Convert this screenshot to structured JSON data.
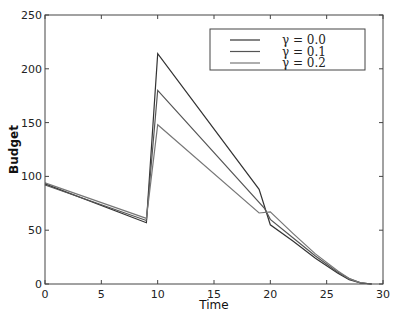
{
  "chart_data": {
    "type": "line",
    "title": "",
    "xlabel": "Time",
    "ylabel": "Budget",
    "xlim": [
      0,
      30
    ],
    "ylim": [
      0,
      250
    ],
    "xticks": [
      0,
      5,
      10,
      15,
      20,
      25,
      30
    ],
    "yticks": [
      0,
      50,
      100,
      150,
      200,
      250
    ],
    "legend_position": "upper right",
    "grid": false,
    "series": [
      {
        "name": "γ = 0.0",
        "color": "#333333",
        "x": [
          0,
          9,
          10,
          19,
          20,
          22,
          24,
          26,
          27,
          28,
          29
        ],
        "y": [
          93,
          57,
          214,
          88,
          55,
          40,
          24,
          10,
          4,
          1,
          0
        ]
      },
      {
        "name": "γ = 0.1",
        "color": "#555555",
        "x": [
          0,
          9,
          10,
          19.5,
          20,
          22,
          24,
          26,
          27,
          28,
          29
        ],
        "y": [
          92,
          59,
          180,
          70,
          60,
          43,
          26,
          11,
          5,
          1,
          0
        ]
      },
      {
        "name": "γ = 0.2",
        "color": "#777777",
        "x": [
          0,
          9,
          10,
          19,
          20,
          22,
          24,
          26,
          27,
          28,
          29
        ],
        "y": [
          94,
          61,
          148,
          66,
          67,
          47,
          28,
          12,
          5,
          1,
          0
        ]
      }
    ]
  }
}
